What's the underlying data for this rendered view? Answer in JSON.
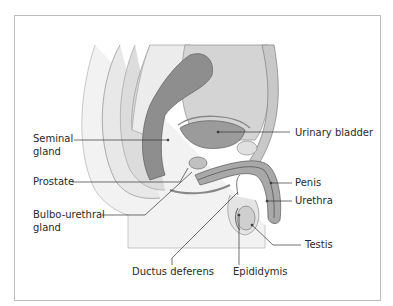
{
  "figure": {
    "labels": {
      "seminal_gland_1": "Seminal",
      "seminal_gland_2": "gland",
      "prostate": "Prostate",
      "bulbo_1": "Bulbo-urethral",
      "bulbo_2": "gland",
      "urinary_bladder": "Urinary bladder",
      "penis": "Penis",
      "urethra": "Urethra",
      "testis": "Testis",
      "ductus_deferens": "Ductus deferens",
      "epididymis": "Epididymis"
    },
    "colors": {
      "frame": "#bdbdbd",
      "tissue_light": "#e6e6e6",
      "tissue_mid": "#bcbcbc",
      "tissue_dark": "#8a8a8a",
      "leader_line": "#333333"
    }
  }
}
